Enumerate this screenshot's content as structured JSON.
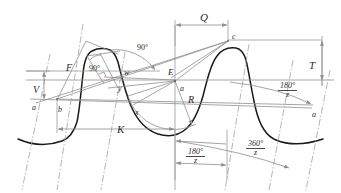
{
  "diagram": {
    "colors": {
      "profile_curve": "#1a1a1a",
      "construction_line": "#8a8a8a",
      "dimension_line": "#9a9a9a",
      "center_line": "#a8a8a8",
      "label_text": "#2b2b2b",
      "background": "#ffffff"
    },
    "labels": [
      {
        "key": "Q",
        "text": "Q",
        "x": 200,
        "y": 12,
        "size": 11,
        "italic": true
      },
      {
        "key": "c",
        "text": "c",
        "x": 232,
        "y": 33,
        "size": 8,
        "italic": true
      },
      {
        "key": "T",
        "text": "T",
        "x": 309,
        "y": 60,
        "size": 11,
        "italic": true
      },
      {
        "key": "angle90a",
        "text": "90°",
        "x": 137,
        "y": 44,
        "size": 8,
        "italic": false
      },
      {
        "key": "angle90b",
        "text": "90°",
        "x": 89,
        "y": 65,
        "size": 8,
        "italic": false
      },
      {
        "key": "F",
        "text": "F",
        "x": 66,
        "y": 63,
        "size": 10,
        "italic": true
      },
      {
        "key": "w",
        "text": "w",
        "x": 124,
        "y": 69,
        "size": 8,
        "italic": true
      },
      {
        "key": "E",
        "text": "E",
        "x": 168,
        "y": 68,
        "size": 9,
        "italic": true
      },
      {
        "key": "y",
        "text": "y",
        "x": 118,
        "y": 85,
        "size": 8,
        "italic": true
      },
      {
        "key": "a_center",
        "text": "a",
        "x": 180,
        "y": 85,
        "size": 8,
        "italic": true
      },
      {
        "key": "V",
        "text": "V",
        "x": 33,
        "y": 85,
        "size": 10,
        "italic": true
      },
      {
        "key": "R",
        "text": "R",
        "x": 188,
        "y": 95,
        "size": 10,
        "italic": true
      },
      {
        "key": "a_left",
        "text": "a",
        "x": 32,
        "y": 104,
        "size": 8,
        "italic": true
      },
      {
        "key": "b",
        "text": "b",
        "x": 58,
        "y": 106,
        "size": 8,
        "italic": true
      },
      {
        "key": "x",
        "text": "x",
        "x": 135,
        "y": 109,
        "size": 8,
        "italic": true
      },
      {
        "key": "a_right",
        "text": "a",
        "x": 312,
        "y": 111,
        "size": 8,
        "italic": true
      },
      {
        "key": "K",
        "text": "K",
        "x": 117,
        "y": 124,
        "size": 11,
        "italic": true
      }
    ],
    "fractions": [
      {
        "key": "frac-180z-right",
        "num": "180°",
        "den": "z",
        "x": 285,
        "y": 84,
        "size": 8
      },
      {
        "key": "frac-360z-bottom",
        "num": "360°",
        "den": "z",
        "x": 253,
        "y": 143,
        "size": 8
      },
      {
        "key": "frac-180z-bottom",
        "num": "180°",
        "den": "z",
        "x": 194,
        "y": 152,
        "size": 8
      }
    ],
    "dimensions": [
      {
        "key": "dim-Q",
        "label": "Q",
        "orientation": "horizontal"
      },
      {
        "key": "dim-T",
        "label": "T",
        "orientation": "vertical"
      },
      {
        "key": "dim-V",
        "label": "V",
        "orientation": "vertical"
      },
      {
        "key": "dim-K",
        "label": "K",
        "orientation": "horizontal"
      },
      {
        "key": "dim-180z-bottom",
        "label": "180°/z",
        "orientation": "horizontal"
      },
      {
        "key": "dim-360z-bottom",
        "label": "360°/z",
        "orientation": "arc"
      },
      {
        "key": "dim-180z-right",
        "label": "180°/z",
        "orientation": "arc"
      }
    ],
    "points": [
      {
        "key": "pt-c",
        "label": "c",
        "x": 228,
        "y": 40
      },
      {
        "key": "pt-E",
        "label": "E",
        "x": 174,
        "y": 80
      },
      {
        "key": "pt-a-center",
        "label": "a",
        "x": 175,
        "y": 80
      },
      {
        "key": "pt-b",
        "label": "b",
        "x": 57,
        "y": 100
      },
      {
        "key": "pt-a-left",
        "label": "a",
        "x": 40,
        "y": 100
      },
      {
        "key": "pt-a-right",
        "label": "a",
        "x": 307,
        "y": 105
      }
    ]
  }
}
